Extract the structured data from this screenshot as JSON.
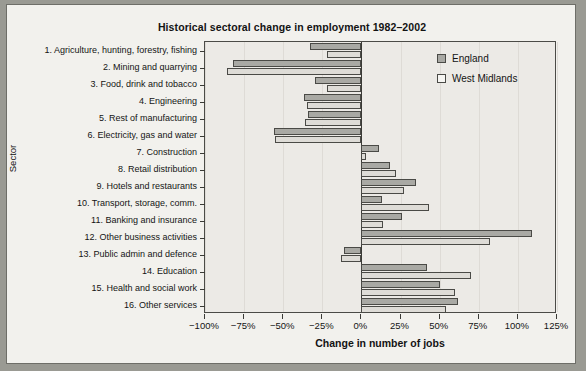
{
  "chart_data": {
    "type": "bar",
    "orientation": "horizontal",
    "title": "Historical sectoral change in employment 1982–2002",
    "xlabel": "Change in number of jobs",
    "ylabel": "Sector",
    "xlim": [
      -100,
      125
    ],
    "xticks": [
      -100,
      -75,
      -50,
      -25,
      0,
      25,
      50,
      75,
      100,
      125
    ],
    "xtick_labels": [
      "−100%",
      "−75%",
      "−50%",
      "−25%",
      "0%",
      "25%",
      "50%",
      "75%",
      "100%",
      "125%"
    ],
    "grid": false,
    "legend_position": "top-right",
    "categories": [
      "1. Agriculture, hunting, forestry, fishing",
      "2. Mining and quarrying",
      "3. Food, drink and tobacco",
      "4. Engineering",
      "5. Rest of manufacturing",
      "6. Electricity, gas and water",
      "7. Construction",
      "8. Retail distribution",
      "9. Hotels and restaurants",
      "10. Transport, storage, comm.",
      "11. Banking and insurance",
      "12. Other business activities",
      "13. Public admin and defence",
      "14. Education",
      "15. Health and social work",
      "16. Other services"
    ],
    "series": [
      {
        "name": "England",
        "color": "#a9a9a4",
        "values": [
          -33,
          -82,
          -30,
          -37,
          -34,
          -56,
          11,
          18,
          35,
          13,
          26,
          109,
          -11,
          42,
          50,
          62
        ]
      },
      {
        "name": "West Midlands",
        "color": "#dedcd7",
        "values": [
          -22,
          -86,
          -22,
          -35,
          -36,
          -55,
          3,
          22,
          27,
          43,
          14,
          82,
          -13,
          70,
          60,
          54
        ]
      }
    ]
  },
  "legend": {
    "entries": [
      {
        "label": "England"
      },
      {
        "label": "West Midlands"
      }
    ]
  }
}
